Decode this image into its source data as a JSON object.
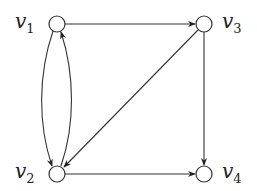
{
  "graph": {
    "type": "directed",
    "nodes": [
      {
        "id": "v1",
        "label": "v",
        "subscript": "1",
        "x": 57,
        "y": 24
      },
      {
        "id": "v2",
        "label": "v",
        "subscript": "2",
        "x": 57,
        "y": 174
      },
      {
        "id": "v3",
        "label": "v",
        "subscript": "3",
        "x": 204,
        "y": 24
      },
      {
        "id": "v4",
        "label": "v",
        "subscript": "4",
        "x": 204,
        "y": 174
      }
    ],
    "edges": [
      {
        "from": "v1",
        "to": "v3",
        "style": "straight"
      },
      {
        "from": "v1",
        "to": "v2",
        "style": "curved-left"
      },
      {
        "from": "v2",
        "to": "v1",
        "style": "curved-right"
      },
      {
        "from": "v3",
        "to": "v2",
        "style": "straight-diagonal"
      },
      {
        "from": "v3",
        "to": "v4",
        "style": "straight"
      },
      {
        "from": "v2",
        "to": "v4",
        "style": "straight"
      }
    ]
  },
  "labels": {
    "v1": {
      "main": "v",
      "sub": "1"
    },
    "v2": {
      "main": "v",
      "sub": "2"
    },
    "v3": {
      "main": "v",
      "sub": "3"
    },
    "v4": {
      "main": "v",
      "sub": "4"
    }
  }
}
